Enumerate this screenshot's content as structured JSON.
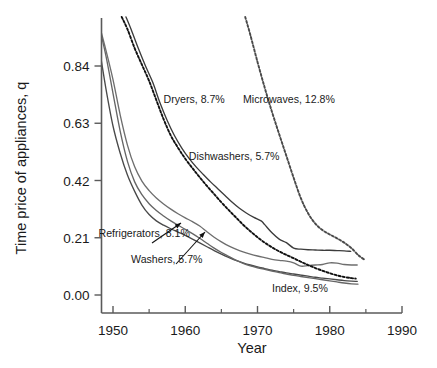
{
  "chart_data": {
    "type": "line",
    "title": "",
    "xlabel": "Year",
    "ylabel": "Time price of appliances, q",
    "xlim": [
      1946,
      1991
    ],
    "ylim": [
      -0.03,
      1.02
    ],
    "xticks": [
      1950,
      1960,
      1970,
      1980,
      1990
    ],
    "xtick_labels": [
      "1950",
      "1960",
      "1970",
      "1980",
      "1990"
    ],
    "xticks_minor": [
      1955,
      1965,
      1975,
      1985
    ],
    "yticks": [
      0.0,
      0.21,
      0.42,
      0.63,
      0.84
    ],
    "ytick_labels": [
      "0.00",
      "0.21",
      "0.42",
      "0.63",
      "0.84"
    ],
    "grid": false,
    "legend_position": "inline-annotations",
    "series": [
      {
        "name": "Refrigerators",
        "label": "Refrigerators, 8.1%",
        "rate": "8.1%",
        "style": "solid",
        "color": "#4a4a4a",
        "x": [
          1947.2,
          1948,
          1949,
          1950,
          1951,
          1952,
          1953,
          1954,
          1955,
          1956,
          1957,
          1958,
          1959,
          1960,
          1961,
          1962,
          1963,
          1964,
          1965,
          1966,
          1967,
          1968,
          1969,
          1970,
          1971,
          1972,
          1973,
          1974,
          1975,
          1976,
          1977,
          1978,
          1979,
          1980,
          1981,
          1982,
          1983,
          1983.8
        ],
        "y": [
          1.02,
          0.92,
          0.76,
          0.62,
          0.52,
          0.44,
          0.38,
          0.33,
          0.295,
          0.272,
          0.256,
          0.243,
          0.231,
          0.219,
          0.205,
          0.191,
          0.177,
          0.163,
          0.15,
          0.138,
          0.127,
          0.118,
          0.11,
          0.103,
          0.097,
          0.091,
          0.086,
          0.081,
          0.077,
          0.073,
          0.069,
          0.065,
          0.062,
          0.059,
          0.056,
          0.053,
          0.051,
          0.05
        ]
      },
      {
        "name": "Washers",
        "label": "Washers, 5.7%",
        "rate": "5.7%",
        "style": "solid",
        "color": "#6e6e6e",
        "x": [
          1947.8,
          1949,
          1950,
          1951,
          1952,
          1953,
          1954,
          1955,
          1956,
          1957,
          1958,
          1959,
          1960,
          1961,
          1962,
          1963,
          1964,
          1965,
          1966,
          1967,
          1968,
          1969,
          1970,
          1971,
          1972,
          1973,
          1974,
          1975,
          1976,
          1977,
          1978,
          1979,
          1980,
          1981,
          1982,
          1983,
          1983.8
        ],
        "y": [
          1.02,
          0.9,
          0.79,
          0.66,
          0.55,
          0.47,
          0.418,
          0.383,
          0.356,
          0.334,
          0.315,
          0.298,
          0.283,
          0.269,
          0.253,
          0.232,
          0.212,
          0.195,
          0.18,
          0.168,
          0.158,
          0.15,
          0.143,
          0.137,
          0.131,
          0.127,
          0.124,
          0.118,
          0.106,
          0.108,
          0.11,
          0.112,
          0.118,
          0.117,
          0.112,
          0.11,
          0.11
        ]
      },
      {
        "name": "Dryers",
        "label": "Dryers, 8.7%",
        "rate": "8.7%",
        "style": "dashed",
        "color": "#111111",
        "x": [
          1951.2,
          1952,
          1953,
          1954,
          1955,
          1956,
          1957,
          1958,
          1959,
          1960,
          1961,
          1962,
          1963,
          1964,
          1965,
          1966,
          1967,
          1968,
          1969,
          1970,
          1971,
          1972,
          1973,
          1974,
          1975,
          1976,
          1977,
          1978,
          1979,
          1980,
          1981,
          1982,
          1983,
          1983.6
        ],
        "y": [
          1.02,
          0.975,
          0.905,
          0.845,
          0.785,
          0.715,
          0.645,
          0.585,
          0.54,
          0.5,
          0.465,
          0.432,
          0.4,
          0.37,
          0.34,
          0.312,
          0.285,
          0.258,
          0.234,
          0.212,
          0.192,
          0.175,
          0.16,
          0.147,
          0.135,
          0.122,
          0.11,
          0.099,
          0.089,
          0.08,
          0.072,
          0.066,
          0.062,
          0.06
        ]
      },
      {
        "name": "Dishwashers",
        "label": "Dishwashers, 5.7%",
        "rate": "5.7%",
        "style": "solid",
        "color": "#3c3c3c",
        "x": [
          1951.8,
          1952.5,
          1953.5,
          1954.5,
          1955.5,
          1956.5,
          1957.5,
          1958.5,
          1959.5,
          1960.5,
          1961.5,
          1962.5,
          1963.5,
          1964.5,
          1965.5,
          1966.5,
          1967.5,
          1968.5,
          1969.5,
          1970.5,
          1971,
          1972,
          1973,
          1974,
          1975,
          1976,
          1977,
          1978,
          1979,
          1980,
          1981,
          1982,
          1982.9
        ],
        "y": [
          1.02,
          0.975,
          0.905,
          0.84,
          0.78,
          0.705,
          0.64,
          0.585,
          0.54,
          0.502,
          0.47,
          0.442,
          0.415,
          0.39,
          0.365,
          0.34,
          0.318,
          0.3,
          0.285,
          0.272,
          0.258,
          0.228,
          0.205,
          0.192,
          0.172,
          0.168,
          0.166,
          0.165,
          0.164,
          0.164,
          0.163,
          0.162,
          0.16
        ]
      },
      {
        "name": "Microwaves",
        "label": "Microwaves, 12.8%",
        "rate": "12.8%",
        "style": "dashed",
        "color": "#4a4a4a",
        "x": [
          1968.3,
          1969,
          1970,
          1971,
          1972,
          1973,
          1974,
          1975,
          1976,
          1977,
          1978,
          1979,
          1980,
          1981,
          1982,
          1983,
          1984,
          1984.8
        ],
        "y": [
          1.02,
          0.955,
          0.855,
          0.76,
          0.672,
          0.59,
          0.51,
          0.43,
          0.355,
          0.3,
          0.262,
          0.238,
          0.222,
          0.208,
          0.192,
          0.172,
          0.145,
          0.13
        ]
      },
      {
        "name": "Index",
        "label": "Index, 9.5%",
        "rate": "9.5%",
        "style": "solid",
        "color": "#666666",
        "x": [
          1947.8,
          1949,
          1950,
          1951,
          1952,
          1953,
          1954,
          1955,
          1956,
          1957,
          1958,
          1959,
          1960,
          1961,
          1962,
          1963,
          1964,
          1965,
          1966,
          1967,
          1968,
          1969,
          1970,
          1971,
          1972,
          1973,
          1974,
          1975,
          1976,
          1977,
          1978,
          1979,
          1980,
          1981,
          1982,
          1983,
          1983.9
        ],
        "y": [
          1.02,
          0.88,
          0.74,
          0.6,
          0.49,
          0.415,
          0.368,
          0.335,
          0.31,
          0.29,
          0.272,
          0.256,
          0.241,
          0.225,
          0.208,
          0.19,
          0.172,
          0.156,
          0.142,
          0.128,
          0.116,
          0.107,
          0.1,
          0.094,
          0.088,
          0.082,
          0.077,
          0.072,
          0.068,
          0.064,
          0.06,
          0.056,
          0.052,
          0.048,
          0.044,
          0.041,
          0.04
        ]
      }
    ],
    "annotations": [
      {
        "name": "dryers",
        "text": "Dryers, 8.7%",
        "x": 1957.0,
        "y": 0.705,
        "anchor": "start",
        "arrow": false
      },
      {
        "name": "microwaves",
        "text": "Microwaves, 12.8%",
        "x": 1968.0,
        "y": 0.705,
        "anchor": "start",
        "arrow": false
      },
      {
        "name": "dishwashers",
        "text": "Dishwashers, 5.7%",
        "x": 1960.5,
        "y": 0.495,
        "anchor": "start",
        "arrow": false
      },
      {
        "name": "refrigerators",
        "text": "Refrigerators, 8.1%",
        "x": 1948.0,
        "y": 0.212,
        "anchor": "start",
        "arrow": true
      },
      {
        "name": "washers",
        "text": "Washers, 5.7%",
        "x": 1952.5,
        "y": 0.118,
        "anchor": "start",
        "arrow": true
      },
      {
        "name": "index",
        "text": "Index, 9.5%",
        "x": 1972.0,
        "y": 0.012,
        "anchor": "start",
        "arrow": false
      }
    ]
  }
}
